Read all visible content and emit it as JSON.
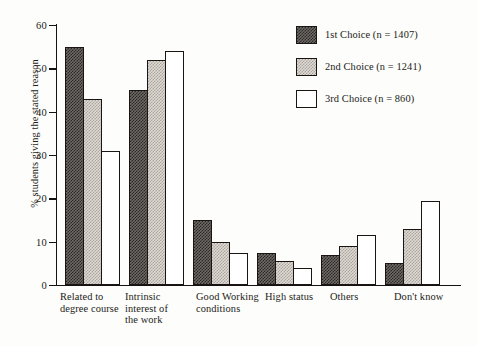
{
  "chart_data": {
    "type": "bar",
    "title": "",
    "xlabel": "",
    "ylabel": "% students giving the stated reason",
    "ylim": [
      0,
      60
    ],
    "yticks": [
      0,
      10,
      20,
      30,
      40,
      50,
      60
    ],
    "grid": false,
    "legend_position": "top-right",
    "categories": [
      "Related to degree course",
      "Intrinsic interest of the work",
      "Good Working conditions",
      "High status",
      "Others",
      "Don't know"
    ],
    "category_lines": [
      [
        "Related to",
        "degree course"
      ],
      [
        "Intrinsic",
        "interest of",
        "the work"
      ],
      [
        "Good Working",
        "conditions"
      ],
      [
        "High status"
      ],
      [
        "Others"
      ],
      [
        "Don't know"
      ]
    ],
    "series": [
      {
        "name": "1st Choice (n = 1407)",
        "short_name": "1st Choice",
        "n": 1407,
        "fill": "dark-crosshatch",
        "values": [
          55,
          45,
          15,
          7.5,
          7,
          5
        ]
      },
      {
        "name": "2nd Choice (n = 1241)",
        "short_name": "2nd Choice",
        "n": 1241,
        "fill": "light-gray-dither",
        "values": [
          43,
          52,
          10,
          5.5,
          9,
          13
        ]
      },
      {
        "name": "3rd Choice (n = 860)",
        "short_name": "3rd Choice",
        "n": 860,
        "fill": "white",
        "values": [
          31,
          54,
          7.5,
          4,
          11.5,
          19.5
        ]
      }
    ]
  },
  "colors": {
    "ink": "#221c18",
    "axis": "#16120f",
    "series_1": "#4a4642",
    "series_2": "#d2cec8",
    "series_3": "#ffffff",
    "background": "#fdfdfb"
  }
}
